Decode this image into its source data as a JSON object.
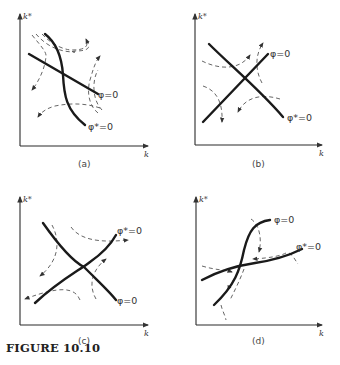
{
  "figure": {
    "title": "FIGURE 10.10"
  },
  "panels": [
    {
      "id": "a",
      "caption": "(a)",
      "y_axis_label": "k*",
      "x_axis_label": "k",
      "curve1_label": "φ=0",
      "curve2_label": "φ*=0",
      "description": "φ=0 gently downward-sloping; φ*=0 steeply downward-sloping; saddle-type dashed trajectories"
    },
    {
      "id": "b",
      "caption": "(b)",
      "y_axis_label": "k*",
      "x_axis_label": "k",
      "curve1_label": "φ=0",
      "curve2_label": "φ*=0",
      "description": "φ=0 upward-sloping; φ*=0 downward-sloping; dashed trajectories"
    },
    {
      "id": "c",
      "caption": "(c)",
      "y_axis_label": "k*",
      "x_axis_label": "k",
      "curve1_label": "φ*=0",
      "curve2_label": "φ=0",
      "description": "φ*=0 upward-sloping; φ=0 downward-sloping; dashed trajectories"
    },
    {
      "id": "d",
      "caption": "(d)",
      "y_axis_label": "k*",
      "x_axis_label": "k",
      "curve1_label": "φ=0",
      "curve2_label": "φ*=0",
      "description": "φ=0 steep S-shaped upward; φ*=0 flat S-shaped upward; dashed trajectories converging"
    }
  ]
}
